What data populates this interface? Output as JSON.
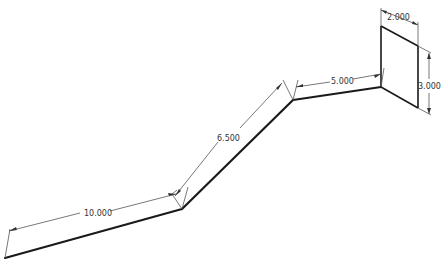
{
  "drawing": {
    "type": "isometric sheet-metal dimension drawing",
    "dimensions": [
      {
        "id": "seg1-length",
        "label": "10.000"
      },
      {
        "id": "seg2-length",
        "label": "6.500"
      },
      {
        "id": "seg3-length",
        "label": "5.000"
      },
      {
        "id": "plate-width",
        "label": "2.000"
      },
      {
        "id": "plate-height",
        "label": "3.000"
      }
    ],
    "colors": {
      "line": "#1a1a1a",
      "dimension": "#555555",
      "background": "#ffffff"
    }
  }
}
